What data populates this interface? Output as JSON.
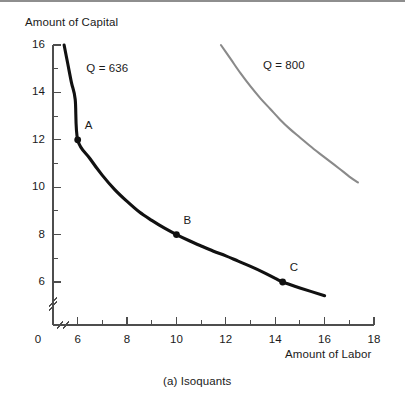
{
  "figure": {
    "caption": "(a) Isoquants",
    "y_axis_title": "Amount of Capital",
    "x_axis_title": "Amount of Labor"
  },
  "chart_data": {
    "type": "line",
    "title": "(a) Isoquants",
    "xlabel": "Amount of Labor",
    "ylabel": "Amount of Capital",
    "xlim": [
      0,
      18
    ],
    "ylim": [
      0,
      16
    ],
    "grid": false,
    "legend": "inline-curve-labels",
    "axis_break": {
      "x": true,
      "y": true,
      "note": "double-slash break marks near origin on both axes"
    },
    "x_ticks_major": [
      0,
      6,
      8,
      10,
      12,
      14,
      16,
      18
    ],
    "x_ticks_minor": [
      7,
      9,
      11,
      13,
      15,
      17
    ],
    "y_ticks_major": [
      6,
      8,
      10,
      12,
      14,
      16
    ],
    "y_ticks_minor": [
      7,
      9,
      11,
      13,
      15
    ],
    "x_tick_labels": [
      "0",
      "6",
      "8",
      "10",
      "12",
      "14",
      "16",
      "18"
    ],
    "y_tick_labels": [
      "6",
      "8",
      "10",
      "12",
      "14",
      "16"
    ],
    "series": [
      {
        "name": "Q = 636",
        "label": "Q = 636",
        "color": "#111111",
        "width": 3.1,
        "points": [
          [
            5.45,
            16.0
          ],
          [
            5.6,
            15.2
          ],
          [
            5.75,
            14.4
          ],
          [
            5.9,
            13.7
          ],
          [
            6.0,
            12.0
          ],
          [
            6.5,
            11.2
          ],
          [
            7.0,
            10.5
          ],
          [
            7.5,
            9.9
          ],
          [
            8.0,
            9.4
          ],
          [
            8.5,
            8.95
          ],
          [
            9.0,
            8.6
          ],
          [
            9.5,
            8.28
          ],
          [
            10.0,
            8.0
          ],
          [
            10.5,
            7.75
          ],
          [
            11.0,
            7.52
          ],
          [
            11.5,
            7.3
          ],
          [
            12.0,
            7.1
          ],
          [
            12.5,
            6.88
          ],
          [
            13.0,
            6.66
          ],
          [
            13.5,
            6.42
          ],
          [
            14.0,
            6.15
          ],
          [
            14.3,
            6.0
          ],
          [
            15.0,
            5.75
          ],
          [
            16.0,
            5.42
          ]
        ],
        "markers": [
          {
            "label": "A",
            "x": 6.0,
            "y": 12.0
          },
          {
            "label": "B",
            "x": 10.0,
            "y": 8.0
          },
          {
            "label": "C",
            "x": 14.3,
            "y": 6.0
          }
        ],
        "label_pos": {
          "x": 6.35,
          "y": 15.0
        }
      },
      {
        "name": "Q = 800",
        "label": "Q = 800",
        "color": "#8a8a8a",
        "width": 2.1,
        "points": [
          [
            11.8,
            16.0
          ],
          [
            12.2,
            15.4
          ],
          [
            12.6,
            14.8
          ],
          [
            13.0,
            14.25
          ],
          [
            13.4,
            13.75
          ],
          [
            13.8,
            13.3
          ],
          [
            14.2,
            12.85
          ],
          [
            14.6,
            12.45
          ],
          [
            15.0,
            12.1
          ],
          [
            15.4,
            11.75
          ],
          [
            15.8,
            11.42
          ],
          [
            16.2,
            11.1
          ],
          [
            16.6,
            10.78
          ],
          [
            17.0,
            10.45
          ],
          [
            17.35,
            10.2
          ]
        ],
        "markers": [],
        "label_pos": {
          "x": 13.5,
          "y": 15.1
        }
      }
    ]
  }
}
